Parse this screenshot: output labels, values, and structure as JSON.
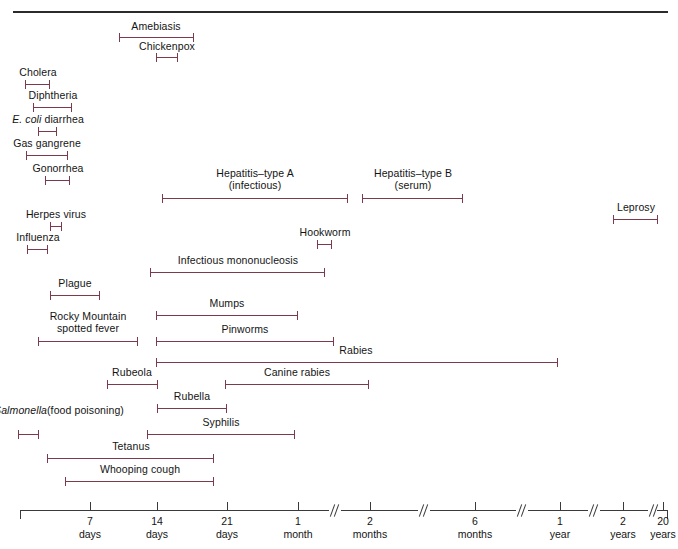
{
  "figure": {
    "type": "range-timeline",
    "title": "",
    "bar_color": "#7c3b4c",
    "axis_color": "#3a3a3a",
    "rule_color": "#2b2b2b",
    "xlabel": "",
    "ylabel": ""
  },
  "axis": {
    "ticks": [
      {
        "value": "",
        "sub": "",
        "x": 20
      },
      {
        "value": "7",
        "sub": "days",
        "x": 90
      },
      {
        "value": "14",
        "sub": "days",
        "x": 157
      },
      {
        "value": "21",
        "sub": "days",
        "x": 227
      },
      {
        "value": "1",
        "sub": "month",
        "x": 298
      },
      {
        "value": "2",
        "sub": "months",
        "x": 370
      },
      {
        "value": "6",
        "sub": "months",
        "x": 475
      },
      {
        "value": "1",
        "sub": "year",
        "x": 560
      },
      {
        "value": "2",
        "sub": "years",
        "x": 623
      },
      {
        "value": "20",
        "sub": "years",
        "x": 663
      }
    ],
    "breaks": [
      329,
      418,
      516,
      588,
      648
    ],
    "segments": [
      {
        "x1": 20,
        "x2": 329
      },
      {
        "x1": 341,
        "x2": 418
      },
      {
        "x1": 430,
        "x2": 516
      },
      {
        "x1": 528,
        "x2": 588
      },
      {
        "x1": 600,
        "x2": 648
      },
      {
        "x1": 657,
        "x2": 668
      }
    ]
  },
  "chart_data": {
    "type": "range-bar",
    "xlabel": "Incubation period",
    "ylabel": "Disease",
    "x_tick_labels": [
      "7 days",
      "14 days",
      "21 days",
      "1 month",
      "2 months",
      "6 months",
      "1 year",
      "2 years",
      "20 years"
    ],
    "grid": false,
    "legend": "none",
    "note": "Axis is piecewise with break marks; x values below are pixel positions of the drawn range endpoints.",
    "entries": [
      {
        "name": "Amebiasis",
        "label": "Amebiasis",
        "italic_prefix": "",
        "x1": 119,
        "x2": 194,
        "bar_y": 33,
        "label_x": 156,
        "label_y": 20,
        "label_align": "centered"
      },
      {
        "name": "Chickenpox",
        "label": "Chickenpox",
        "italic_prefix": "",
        "x1": 156,
        "x2": 178,
        "bar_y": 53,
        "label_x": 167,
        "label_y": 40,
        "label_align": "centered"
      },
      {
        "name": "Cholera",
        "label": "Cholera",
        "italic_prefix": "",
        "x1": 25,
        "x2": 50,
        "bar_y": 80,
        "label_x": 38,
        "label_y": 66,
        "label_align": "centered"
      },
      {
        "name": "Diphtheria",
        "label": "Diphtheria",
        "italic_prefix": "",
        "x1": 33,
        "x2": 72,
        "bar_y": 103,
        "label_x": 53,
        "label_y": 89,
        "label_align": "centered"
      },
      {
        "name": "E. coli diarrhea",
        "label": " diarrhea",
        "italic_prefix": "E. coli",
        "x1": 38,
        "x2": 57,
        "bar_y": 127,
        "label_x": 48,
        "label_y": 113,
        "label_align": "centered"
      },
      {
        "name": "Gas gangrene",
        "label": "Gas gangrene",
        "italic_prefix": "",
        "x1": 26,
        "x2": 68,
        "bar_y": 151,
        "label_x": 47,
        "label_y": 137,
        "label_align": "centered"
      },
      {
        "name": "Gonorrhea",
        "label": "Gonorrhea",
        "italic_prefix": "",
        "x1": 45,
        "x2": 70,
        "bar_y": 176,
        "label_x": 58,
        "label_y": 162,
        "label_align": "centered"
      },
      {
        "name": "Hepatitis-type A (infectious)",
        "label": "Hepatitis–type A",
        "label2": "(infectious)",
        "italic_prefix": "",
        "x1": 162,
        "x2": 348,
        "bar_y": 194,
        "label_x": 255,
        "label_y": 168,
        "label_align": "centered"
      },
      {
        "name": "Hepatitis-type B (serum)",
        "label": "Hepatitis–type B",
        "label2": "(serum)",
        "italic_prefix": "",
        "x1": 362,
        "x2": 463,
        "bar_y": 194,
        "label_x": 413,
        "label_y": 168,
        "label_align": "centered"
      },
      {
        "name": "Leprosy",
        "label": "Leprosy",
        "italic_prefix": "",
        "x1": 613,
        "x2": 658,
        "bar_y": 215,
        "label_x": 636,
        "label_y": 201,
        "label_align": "centered"
      },
      {
        "name": "Herpes virus",
        "label": "Herpes virus",
        "italic_prefix": "",
        "x1": 50,
        "x2": 62,
        "bar_y": 222,
        "label_x": 56,
        "label_y": 208,
        "label_align": "centered"
      },
      {
        "name": "Influenza",
        "label": "Influenza",
        "italic_prefix": "",
        "x1": 27,
        "x2": 48,
        "bar_y": 245,
        "label_x": 38,
        "label_y": 231,
        "label_align": "centered"
      },
      {
        "name": "Hookworm",
        "label": "Hookworm",
        "italic_prefix": "",
        "x1": 317,
        "x2": 332,
        "bar_y": 240,
        "label_x": 325,
        "label_y": 226,
        "label_align": "centered"
      },
      {
        "name": "Infectious mononucleosis",
        "label": "Infectious mononucleosis",
        "italic_prefix": "",
        "x1": 150,
        "x2": 325,
        "bar_y": 268,
        "label_x": 238,
        "label_y": 254,
        "label_align": "centered"
      },
      {
        "name": "Plague",
        "label": "Plague",
        "italic_prefix": "",
        "x1": 50,
        "x2": 100,
        "bar_y": 291,
        "label_x": 75,
        "label_y": 277,
        "label_align": "centered"
      },
      {
        "name": "Mumps",
        "label": "Mumps",
        "italic_prefix": "",
        "x1": 156,
        "x2": 298,
        "bar_y": 311,
        "label_x": 227,
        "label_y": 297,
        "label_align": "centered"
      },
      {
        "name": "Pinworms",
        "label": "Pinworms",
        "italic_prefix": "",
        "x1": 156,
        "x2": 334,
        "bar_y": 337,
        "label_x": 245,
        "label_y": 323,
        "label_align": "centered"
      },
      {
        "name": "Rocky Mountain spotted fever",
        "label": "Rocky Mountain",
        "label2": "spotted fever",
        "italic_prefix": "",
        "x1": 38,
        "x2": 138,
        "bar_y": 337,
        "label_x": 88,
        "label_y": 311,
        "label_align": "centered"
      },
      {
        "name": "Rabies",
        "label": "Rabies",
        "italic_prefix": "",
        "x1": 156,
        "x2": 558,
        "bar_y": 358,
        "label_x": 356,
        "label_y": 344,
        "label_align": "centered"
      },
      {
        "name": "Rubeola",
        "label": "Rubeola",
        "italic_prefix": "",
        "x1": 107,
        "x2": 158,
        "bar_y": 380,
        "label_x": 132,
        "label_y": 366,
        "label_align": "centered"
      },
      {
        "name": "Canine rabies",
        "label": "Canine rabies",
        "italic_prefix": "",
        "x1": 225,
        "x2": 369,
        "bar_y": 380,
        "label_x": 297,
        "label_y": 366,
        "label_align": "centered"
      },
      {
        "name": "Rubella",
        "label": "Rubella",
        "italic_prefix": "",
        "x1": 157,
        "x2": 227,
        "bar_y": 404,
        "label_x": 192,
        "label_y": 390,
        "label_align": "centered"
      },
      {
        "name": "Salmonella (food poisoning)",
        "label": "(food poisoning)",
        "italic_prefix": "Salmonella",
        "x1": 18,
        "x2": 39,
        "bar_y": 430,
        "label_x": 59,
        "label_y": 404,
        "label_align": "centered"
      },
      {
        "name": "Syphilis",
        "label": "Syphilis",
        "italic_prefix": "",
        "x1": 147,
        "x2": 295,
        "bar_y": 430,
        "label_x": 221,
        "label_y": 416,
        "label_align": "centered"
      },
      {
        "name": "Tetanus",
        "label": "Tetanus",
        "italic_prefix": "",
        "x1": 47,
        "x2": 214,
        "bar_y": 454,
        "label_x": 131,
        "label_y": 440,
        "label_align": "centered"
      },
      {
        "name": "Whooping cough",
        "label": "Whooping cough",
        "italic_prefix": "",
        "x1": 65,
        "x2": 214,
        "bar_y": 477,
        "label_x": 140,
        "label_y": 463,
        "label_align": "centered"
      }
    ]
  }
}
